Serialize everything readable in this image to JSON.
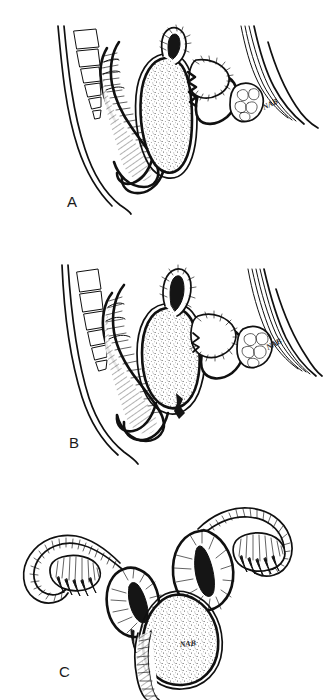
{
  "figure": {
    "medium": "pen-and-ink line drawing",
    "background_color": "#ffffff",
    "ink_color": "#101010",
    "panel_count": 3
  },
  "panels": [
    {
      "id": "A",
      "label": "A",
      "view": "midsagittal-section",
      "signature": "NAB",
      "structures": [
        "sacrum-vertebral-segments",
        "rectum",
        "uterus-stippled",
        "cervix",
        "bladder",
        "pubic-symphysis",
        "vagina",
        "abdominal-wall"
      ]
    },
    {
      "id": "B",
      "label": "B",
      "view": "midsagittal-section",
      "signature": "NAB",
      "structures": [
        "sacrum-vertebral-segments",
        "rectum",
        "uterus-stippled",
        "cervix",
        "bladder",
        "pubic-symphysis",
        "vagina",
        "abdominal-wall"
      ]
    },
    {
      "id": "C",
      "label": "C",
      "view": "anterior-coronal-view",
      "signature": "NAB",
      "structures": [
        "uterus-body-stippled",
        "uterine-cavity",
        "fallopian-tube-left",
        "fallopian-tube-right",
        "ovary-left",
        "ovary-right",
        "fimbriae",
        "cervix",
        "vaginal-canal"
      ]
    }
  ],
  "labels": {
    "panel_a": "A",
    "panel_b": "B",
    "panel_c": "C",
    "artist_signature": "NAB"
  }
}
